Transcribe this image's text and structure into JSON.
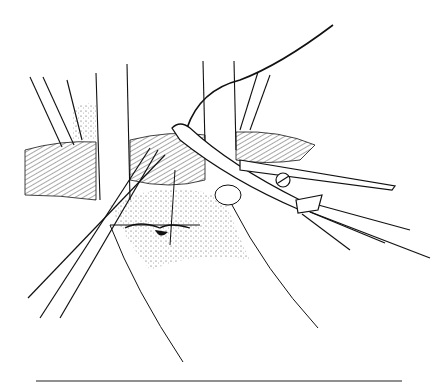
{
  "illustration": {
    "subject": "surgical line drawing: forceps and curved clamp with suture over vessel",
    "colors": {
      "ink": "#111111",
      "background": "#ffffff",
      "stipple": "#555555"
    }
  }
}
